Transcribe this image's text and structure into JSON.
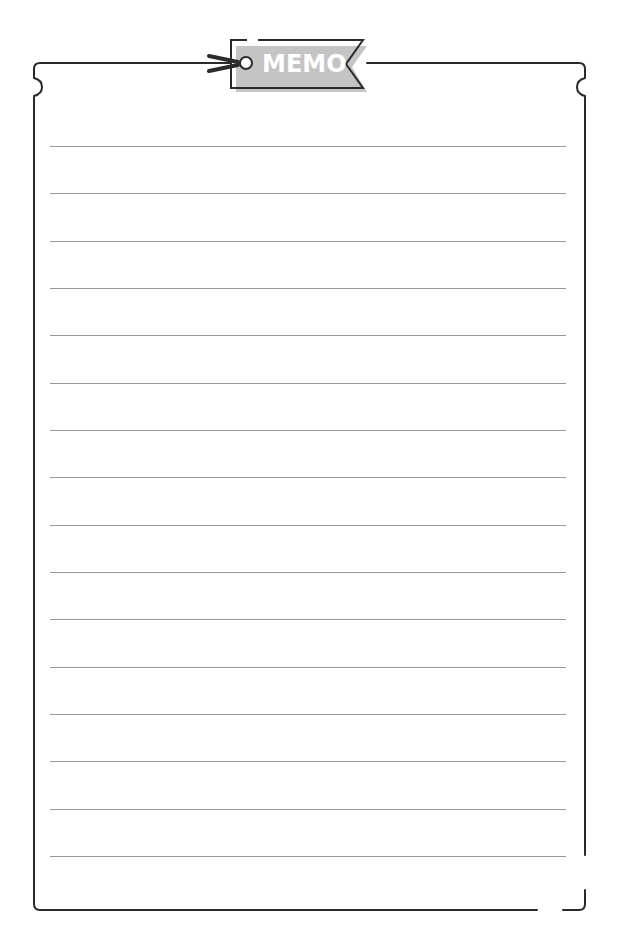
{
  "memo": {
    "tag_label": "MEMO",
    "icons": [
      "tag-hole-icon",
      "tie-string-icon"
    ],
    "colors": {
      "border": "#2a2a2a",
      "tag_fill": "#c4c4c4",
      "tag_text": "#ffffff",
      "ruled_line": "#9a9a9a",
      "background": "#ffffff"
    },
    "ruled_line_count": 16
  }
}
